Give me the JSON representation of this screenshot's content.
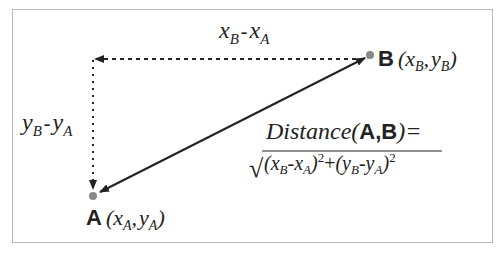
{
  "diagram": {
    "points": {
      "A": {
        "label": "A",
        "coord_open": "(",
        "x": "x",
        "x_sub": "A",
        "sep": ",",
        "y": "y",
        "y_sub": "A",
        "coord_close": ")"
      },
      "B": {
        "label": "B",
        "coord_open": "(",
        "x": "x",
        "x_sub": "B",
        "sep": ",",
        "y": "y",
        "y_sub": "B",
        "coord_close": ")"
      }
    },
    "dx_label": {
      "a": "x",
      "a_sub": "B",
      "op": "-",
      "b": "x",
      "b_sub": "A"
    },
    "dy_label": {
      "a": "y",
      "a_sub": "B",
      "op": "-",
      "b": "y",
      "b_sub": "A"
    },
    "formula": {
      "lhs_word": "Distance(",
      "lhs_A": "A",
      "lhs_comma": ",",
      "lhs_B": "B",
      "lhs_close": ")=",
      "term1_open": "(x",
      "term1_sub1": "B",
      "term1_minus": "-x",
      "term1_sub2": "A",
      "term1_close": ")",
      "exp1": "2",
      "plus": "+",
      "term2_open": "(y",
      "term2_sub1": "B",
      "term2_minus": "-y",
      "term2_sub2": "A",
      "term2_close": ")",
      "exp2": "2",
      "sqrt": "√"
    },
    "colors": {
      "line": "#222222",
      "point": "#888888",
      "frame": "#b8b8b8"
    }
  }
}
